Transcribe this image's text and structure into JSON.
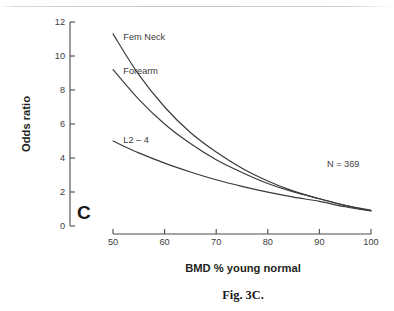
{
  "figure": {
    "caption": "Fig. 3C.",
    "panel_letter": "C",
    "annotation": "N = 369"
  },
  "chart_data": {
    "type": "line",
    "title": "",
    "subtitle": "",
    "xlabel": "BMD % young normal",
    "ylabel": "Odds ratio",
    "xlim": [
      50,
      100
    ],
    "ylim": [
      0,
      12
    ],
    "xticks": [
      50,
      60,
      70,
      80,
      90,
      100
    ],
    "xtick_labels": [
      "50",
      "60",
      "70",
      "80",
      "90",
      "100"
    ],
    "yticks": [
      0,
      2,
      4,
      6,
      8,
      10,
      12
    ],
    "ytick_labels": [
      "0",
      "2",
      "4",
      "6",
      "8",
      "10",
      "12"
    ],
    "grid": false,
    "legend_position": "inline-left-of-curves",
    "annotations": [
      {
        "text": "N = 369",
        "x": 91.5,
        "y": 3.35
      },
      {
        "text": "C",
        "x": 51.0,
        "y": 1.0
      }
    ],
    "x": [
      50,
      55,
      60,
      65,
      70,
      75,
      80,
      85,
      90,
      95,
      100
    ],
    "series": [
      {
        "name": "Fem Neck",
        "label": "Fem Neck",
        "label_x": 52.0,
        "label_y": 11.15,
        "values": [
          11.3,
          8.9,
          7.0,
          5.5,
          4.35,
          3.4,
          2.65,
          2.05,
          1.6,
          1.2,
          0.9
        ]
      },
      {
        "name": "Forearm",
        "label": "Forearm",
        "label_x": 52.0,
        "label_y": 9.15,
        "values": [
          9.2,
          7.45,
          6.0,
          4.85,
          3.9,
          3.15,
          2.5,
          2.0,
          1.6,
          1.22,
          0.92
        ]
      },
      {
        "name": "L2 – 4",
        "label": "L2 – 4",
        "label_x": 52.0,
        "label_y": 5.05,
        "values": [
          5.0,
          4.3,
          3.7,
          3.18,
          2.72,
          2.33,
          1.99,
          1.7,
          1.45,
          1.13,
          0.88
        ]
      }
    ]
  }
}
